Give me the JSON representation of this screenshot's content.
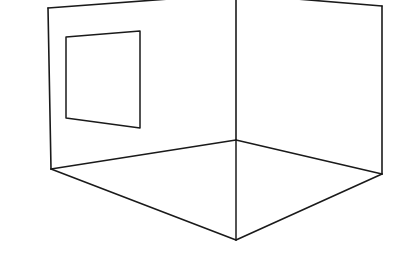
{
  "drawing": {
    "title": "Interior room corner perspective line drawing",
    "description": "Two-point perspective wireframe of an empty room interior showing a left wall, a right wall, a floor plane, and a rectangular window opening on the left wall",
    "background_color": "#ffffff",
    "line_color": "#1a1a1a",
    "line_width": 1.6,
    "canvas": {
      "width": 415,
      "height": 266
    }
  },
  "geometry": {
    "vertices": {
      "left_wall_top_back": {
        "x": 48,
        "y": 8
      },
      "left_wall_top_front": {
        "x": 236,
        "y": 0
      },
      "left_wall_bottom_back": {
        "x": 51,
        "y": 169
      },
      "inner_corner_top": {
        "x": 236,
        "y": 0
      },
      "inner_corner_bottom": {
        "x": 236,
        "y": 140
      },
      "right_wall_top_back": {
        "x": 382,
        "y": 6
      },
      "right_wall_bottom_back": {
        "x": 382,
        "y": 174
      },
      "floor_front_vertex": {
        "x": 236,
        "y": 240
      }
    },
    "window": {
      "top_left": {
        "x": 66,
        "y": 37
      },
      "top_right": {
        "x": 140,
        "y": 31
      },
      "bottom_right": {
        "x": 140,
        "y": 128
      },
      "bottom_left": {
        "x": 66,
        "y": 118
      }
    },
    "paths": {
      "left_wall_top_edge": "M 236 -6 L 48 8",
      "left_wall_back_edge": "M 48 8 L 51 169",
      "right_wall_top_edge": "M 236 -6 L 382 6",
      "right_wall_back_edge": "M 382 6 L 382 174",
      "inner_corner_vertical": "M 236 -6 L 236 140",
      "floor_left_back": "M 51 169 L 236 140",
      "floor_right_back": "M 236 140 L 382 174",
      "floor_left_front": "M 51 169 L 236 240",
      "floor_right_front": "M 236 240 L 382 174",
      "floor_center_vertical": "M 236 140 L 236 240",
      "window_outline": "M 66 37 L 140 31 L 140 128 L 66 118 Z"
    }
  },
  "elements": {
    "left_wall_label": "Left wall",
    "right_wall_label": "Right wall",
    "floor_label": "Floor plane",
    "window_label": "Window opening",
    "corner_label": "Interior corner"
  }
}
